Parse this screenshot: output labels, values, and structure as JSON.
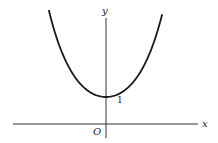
{
  "chart_data": {
    "type": "line",
    "title": "",
    "function": "y = cosh(x)",
    "xlabel": "x",
    "ylabel": "y",
    "origin_label": "O",
    "annotations": [
      {
        "text": "1",
        "x": 0,
        "y": 1,
        "note": "y-intercept / minimum of curve"
      }
    ],
    "x": [
      -2.1,
      -1.5,
      -1.0,
      -0.5,
      0,
      0.5,
      1.0,
      1.5,
      2.1
    ],
    "series": [
      {
        "name": "cosh(x)",
        "values": [
          4.14,
          2.35,
          1.54,
          1.13,
          1.0,
          1.13,
          1.54,
          2.35,
          4.14
        ]
      }
    ],
    "grid": false,
    "legend": null
  },
  "labels": {
    "x_axis": "x",
    "y_axis": "y",
    "origin": "O",
    "intercept": "1"
  },
  "colors": {
    "curve": "#1a1a1a",
    "axes": "#333333",
    "background": "#ffffff"
  }
}
